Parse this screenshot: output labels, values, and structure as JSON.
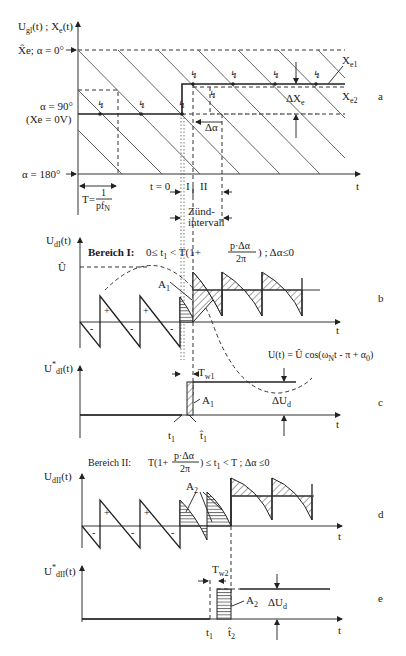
{
  "figure": {
    "panel_a": {
      "panel_label": "a",
      "y_axis_label": "U",
      "y_axis_sub": "gl",
      "y_axis_rest": "(t) ; X",
      "y_axis_sub2": "e",
      "y_axis_tail": "(t)",
      "level_top": "X̂e; α = 0°",
      "level_mid_1": "α = 90°",
      "level_mid_2": "(Xe = 0V)",
      "level_bottom": "α = 180°",
      "x_axis_label": "t",
      "period_label": "T=",
      "period_num": "1",
      "period_den": "pf",
      "period_den_sub": "N",
      "t0_label": "t = 0",
      "region_I": "I",
      "region_II": "II",
      "firing_interval_1": "Zünd-",
      "firing_interval_2": "intervall",
      "xe1_label": "X",
      "xe1_sub": "e1",
      "xe2_label": "X",
      "xe2_sub": "e2",
      "delta_xe_label": "ΔX",
      "delta_xe_sub": "e",
      "delta_alpha_label": "Δα"
    },
    "panel_b": {
      "panel_label": "b",
      "y_axis_label": "U",
      "y_axis_sub": "dI",
      "y_axis_tail": "(t)",
      "region_title": "Bereich I:",
      "condition_left": "0≤ t",
      "condition_sub": "1",
      "condition_mid": " < T(1+",
      "frac_num": "p·Δα",
      "frac_den": "2π",
      "condition_right": ") ; Δα≤0",
      "peak_label": "Û",
      "area_label": "A",
      "area_sub": "1",
      "plus_sign": "+",
      "minus_sign": "-",
      "x_axis_label": "t",
      "formula_left": "U(t) = Û cos(ω",
      "formula_sub": "N",
      "formula_mid": "t - ",
      "formula_frac_num": "π",
      "formula_frac_den": "p",
      "formula_right": " + α",
      "formula_sub2": "0",
      "formula_end": ")"
    },
    "panel_c": {
      "panel_label": "c",
      "y_axis_label": "U",
      "y_axis_sup": "*",
      "y_axis_sub": "dI",
      "y_axis_tail": "(t)",
      "tw_label": "T",
      "tw_sub": "w1",
      "area_label": "A",
      "area_sub": "1",
      "delta_ud_label": "ΔU",
      "delta_ud_sub": "d",
      "t1_label": "t",
      "t1_sub": "1",
      "t1hat_label": "t̂",
      "t1hat_sub": "1",
      "x_axis_label": "t"
    },
    "panel_d": {
      "panel_label": "d",
      "y_axis_label": "U",
      "y_axis_sub": "dII",
      "y_axis_tail": "(t)",
      "region_title": "Bereich II:",
      "condition_left": "T(1+",
      "frac_num": "p·Δα",
      "frac_den": "2π",
      "condition_mid": ") ≤ t",
      "condition_sub": "1",
      "condition_right": " < T ; Δα ≤0",
      "area_label": "A",
      "area_sub": "2",
      "plus_sign": "+",
      "minus_sign": "-",
      "x_axis_label": "t"
    },
    "panel_e": {
      "panel_label": "e",
      "y_axis_label": "U",
      "y_axis_sup": "*",
      "y_axis_sub": "dII",
      "y_axis_tail": "(t)",
      "tw_label": "T",
      "tw_sub": "w2",
      "area_label": "A",
      "area_sub": "2",
      "delta_ud_label": "ΔU",
      "delta_ud_sub": "d",
      "t1_label": "t",
      "t1_sub": "1",
      "t2hat_label": "t̂",
      "t2hat_sub": "2",
      "x_axis_label": "t"
    },
    "lightning_icon": "↯"
  }
}
